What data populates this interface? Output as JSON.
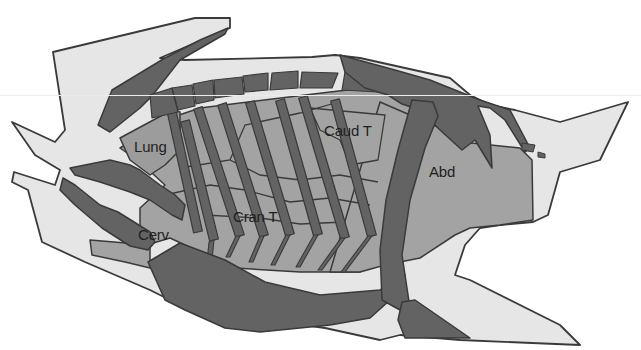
{
  "diagram": {
    "colors": {
      "background": "#ffffff",
      "body_outline_fill": "#e6e6e6",
      "stroke": "#3a3a3a",
      "region_fill": "#a3a3a3",
      "bone_fill": "#636363",
      "lung_fill": "#9c9c9c"
    },
    "labels": [
      {
        "id": "lung",
        "text": "Lung",
        "x": 134,
        "y": 138
      },
      {
        "id": "caud-t",
        "text": "Caud T",
        "x": 324,
        "y": 122
      },
      {
        "id": "abd",
        "text": "Abd",
        "x": 429,
        "y": 163
      },
      {
        "id": "cran-t",
        "text": "Cran T",
        "x": 233,
        "y": 208
      },
      {
        "id": "cerv",
        "text": "Cerv",
        "x": 138,
        "y": 226
      }
    ]
  },
  "shapes": {
    "body_outline": "53,52 195,18 230,18 230,28 160,58 185,60 312,57 335,55 360,58 450,78 470,95 490,105 515,110 560,122 628,102 600,160 560,172 548,215 533,222 500,225 480,228 465,245 455,275 470,280 560,325 580,345 460,340 400,335 380,340 325,328 255,318 200,305 180,305 150,290 85,262 42,242 28,190 12,182 14,172 55,185 60,170 35,155 12,122 55,142 65,130 ",
    "thorax_region": "120,148 170,118 200,108 330,92 365,88 410,100 430,120 445,137 455,150 470,170 470,215 448,225 420,232 400,240 380,258 360,272 300,272 235,268 210,262 185,245 170,238 150,244 140,238 140,208 165,185 140,162",
    "abd_region": "380,102 440,128 462,142 520,148 532,160 533,220 500,225 470,228 455,235 420,258 385,265 360,272 330,272",
    "lung_outline": "120,138 172,110 180,112 180,150 165,165 150,175 130,160",
    "caud_box": "310,108 385,115 378,160 350,165 340,140 320,130",
    "scapula_top": "98,125 112,90 165,58 200,40 228,28 225,34 180,60 152,96 140,108 110,132",
    "spine_blocks": [
      "150,95 172,88 178,112 152,118",
      "172,88 192,85 195,106 178,110",
      "193,84 213,80 214,100 196,104",
      "214,80 242,77 244,94 215,98",
      "243,76 268,73 268,90 245,92",
      "272,73 298,71 298,88 270,90",
      "302,72 338,73 332,88 300,88",
      "345,72 376,77 378,92 342,90"
    ],
    "pelvis_dorsal": "340,55 395,70 430,80 480,100 510,110 530,148 525,152 505,120 490,108 478,106 490,135 492,168 475,140 462,150 440,130 420,110 402,104 388,95 365,88 345,72",
    "pelvis_small1": "522,143 535,145 533,152 522,150",
    "pelvis_small2": "538,152 545,154 545,158 538,157",
    "femur": "412,100 433,102 438,116 425,148 410,200 402,255 410,308 400,310 382,300 380,250 386,200 398,150",
    "femur_lower": "402,302 415,300 470,338 405,338 398,320",
    "forelimb_humerus": "63,178 75,185 100,205 118,212 150,232 155,242 148,250 130,246 102,228 75,205 60,190",
    "forelimb_upper": "70,168 110,160 130,165 140,170 160,185 175,195 185,205 182,220 172,215 150,200 130,192 100,182 75,175",
    "cerv_region": "90,240 150,245 150,268 125,262 92,255",
    "sternum_mass": "148,262 180,243 225,260 265,282 320,295 380,290 405,275 390,300 370,318 330,325 260,332 225,328 185,310 165,300",
    "ribs": [
      {
        "x1": 170,
        "y1": 104,
        "x2": 198,
        "y2": 232
      },
      {
        "x1": 185,
        "y1": 121,
        "x2": 214,
        "y2": 240
      },
      {
        "x1": 198,
        "y1": 108,
        "x2": 240,
        "y2": 236
      },
      {
        "x1": 222,
        "y1": 104,
        "x2": 264,
        "y2": 236
      },
      {
        "x1": 250,
        "y1": 102,
        "x2": 290,
        "y2": 235
      },
      {
        "x1": 280,
        "y1": 100,
        "x2": 318,
        "y2": 235
      },
      {
        "x1": 303,
        "y1": 97,
        "x2": 345,
        "y2": 238
      },
      {
        "x1": 335,
        "y1": 100,
        "x2": 372,
        "y2": 236
      }
    ],
    "costal_cartilages": [
      "214,240 212,260 207,262 209,242",
      "240,236 230,257 226,257 236,236",
      "264,236 253,262 249,262 260,236",
      "290,235 275,265 271,265 286,235",
      "318,235 300,267 296,267 314,235",
      "345,238 322,270 318,270 341,238",
      "372,236 345,272 341,272 368,236"
    ],
    "inner_lines": [
      "180,168 230,160 245,125 300,113 335,103",
      "230,160 260,175 300,180 340,175 378,182",
      "165,195 210,185 245,190 290,202 330,198 370,205",
      "205,215 260,218 300,224 345,222"
    ]
  }
}
